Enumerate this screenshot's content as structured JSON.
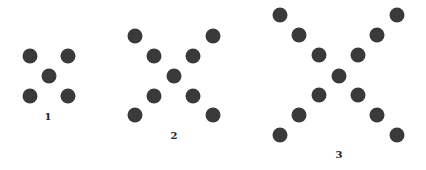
{
  "diagram": {
    "title": "",
    "dot_color": "#3a3a3a",
    "dot_diameter": 15,
    "figures": [
      {
        "label": "1",
        "label_pos": [
          48,
          117
        ],
        "dots": [
          [
            30,
            56
          ],
          [
            68,
            56
          ],
          [
            49,
            76
          ],
          [
            30,
            96
          ],
          [
            68,
            96
          ]
        ]
      },
      {
        "label": "2",
        "label_pos": [
          174,
          136
        ],
        "dots": [
          [
            135,
            36
          ],
          [
            213,
            36
          ],
          [
            154,
            56
          ],
          [
            193,
            56
          ],
          [
            174,
            76
          ],
          [
            154,
            96
          ],
          [
            193,
            96
          ],
          [
            135,
            115
          ],
          [
            213,
            115
          ]
        ]
      },
      {
        "label": "3",
        "label_pos": [
          339,
          155
        ],
        "dots": [
          [
            280,
            15
          ],
          [
            397,
            15
          ],
          [
            299,
            35
          ],
          [
            377,
            35
          ],
          [
            319,
            55
          ],
          [
            358,
            55
          ],
          [
            339,
            76
          ],
          [
            319,
            95
          ],
          [
            358,
            95
          ],
          [
            299,
            115
          ],
          [
            377,
            115
          ],
          [
            280,
            135
          ],
          [
            397,
            135
          ]
        ]
      }
    ]
  }
}
